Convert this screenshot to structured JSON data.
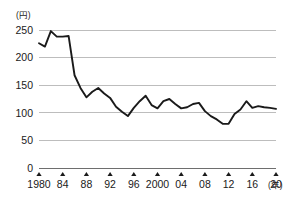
{
  "chart_data": {
    "type": "line",
    "title": "",
    "subtitle": "",
    "xlabel": "(年)",
    "ylabel": "(円)",
    "y_unit_label": "(円)",
    "x_unit_label": "(年)",
    "xlim": [
      1980,
      2020
    ],
    "ylim": [
      0,
      250
    ],
    "grid": true,
    "legend": false,
    "legend_position": "none",
    "line_color": "#1a1a1a",
    "grid_color": "#bdbdbd",
    "axis_color": "#6e6e6e",
    "background_color": "#ffffff",
    "ytick_labels": [
      "250",
      "200",
      "150",
      "100",
      "50",
      "0"
    ],
    "ytick_values": [
      250,
      200,
      150,
      100,
      50,
      0
    ],
    "xtick_labels": [
      "1980",
      "84",
      "88",
      "92",
      "96",
      "2000",
      "04",
      "08",
      "12",
      "16",
      "20"
    ],
    "xtick_values": [
      1980,
      1984,
      1988,
      1992,
      1996,
      2000,
      2004,
      2008,
      2012,
      2016,
      2020
    ],
    "x": [
      1980,
      1981,
      1982,
      1983,
      1984,
      1985,
      1986,
      1987,
      1988,
      1989,
      1990,
      1991,
      1992,
      1993,
      1994,
      1995,
      1996,
      1997,
      1998,
      1999,
      2000,
      2001,
      2002,
      2003,
      2004,
      2005,
      2006,
      2007,
      2008,
      2009,
      2010,
      2011,
      2012,
      2013,
      2014,
      2015,
      2016,
      2017,
      2018,
      2019,
      2020
    ],
    "values": [
      226,
      220,
      248,
      238,
      238,
      239,
      168,
      145,
      128,
      138,
      145,
      135,
      127,
      111,
      102,
      94,
      109,
      121,
      131,
      114,
      108,
      121,
      125,
      116,
      108,
      110,
      116,
      118,
      103,
      94,
      88,
      80,
      80,
      98,
      106,
      121,
      109,
      112,
      110,
      109,
      107
    ],
    "series": [
      {
        "name": "円相場",
        "values": [
          226,
          220,
          248,
          238,
          238,
          239,
          168,
          145,
          128,
          138,
          145,
          135,
          127,
          111,
          102,
          94,
          109,
          121,
          131,
          114,
          108,
          121,
          125,
          116,
          108,
          110,
          116,
          118,
          103,
          94,
          88,
          80,
          80,
          98,
          106,
          121,
          109,
          112,
          110,
          109,
          107
        ]
      }
    ]
  }
}
